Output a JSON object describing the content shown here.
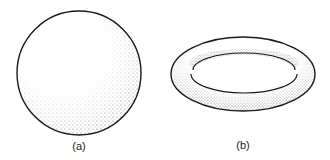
{
  "figures": [
    {
      "id": "a",
      "label": "(a)",
      "shape": "sphere"
    },
    {
      "id": "b",
      "label": "(b)",
      "shape": "torus"
    }
  ],
  "colors": {
    "stroke": "#1a1a1a",
    "stipple": "#555555",
    "background": "#ffffff"
  }
}
